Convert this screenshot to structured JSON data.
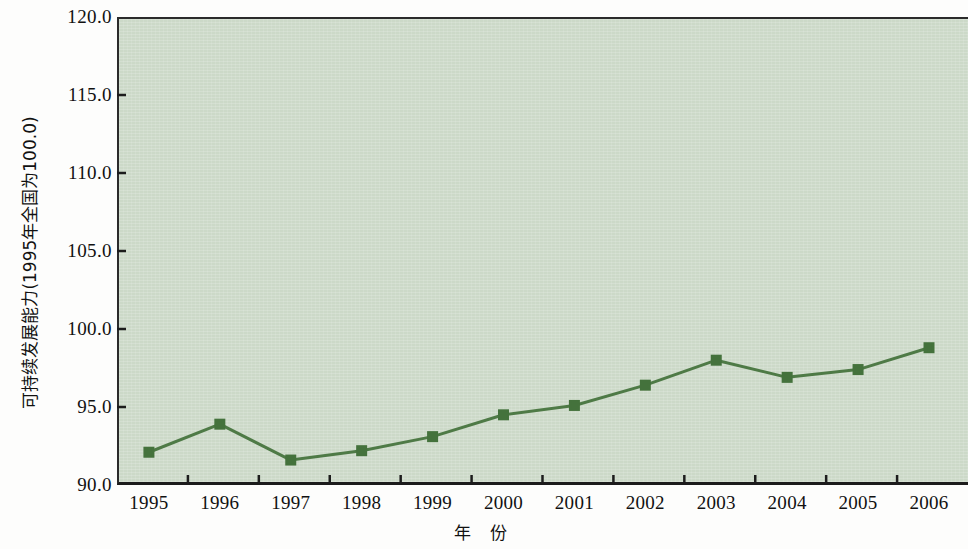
{
  "chart_data": {
    "type": "line",
    "title": "",
    "subtitle": "",
    "xlabel": "年 份",
    "ylabel": "可持续发展能力(1995年全国为100.0)",
    "categories": [
      "1995",
      "1996",
      "1997",
      "1998",
      "1999",
      "2000",
      "2001",
      "2002",
      "2003",
      "2004",
      "2005",
      "2006"
    ],
    "series": [
      {
        "name": "可持续发展能力",
        "values": [
          92.1,
          93.9,
          91.6,
          92.2,
          93.1,
          94.5,
          95.1,
          96.4,
          98.0,
          96.9,
          97.4,
          98.8
        ]
      }
    ],
    "ylim": [
      90.0,
      120.0
    ],
    "ytick_labels": [
      "90.0",
      "95.0",
      "100.0",
      "105.0",
      "110.0",
      "115.0",
      "120.0"
    ],
    "ytick_values": [
      90.0,
      95.0,
      100.0,
      105.0,
      110.0,
      115.0,
      120.0
    ],
    "xtick_labels": [
      "1995",
      "1996",
      "1997",
      "1998",
      "1999",
      "2000",
      "2001",
      "2002",
      "2003",
      "2004",
      "2005",
      "2006"
    ],
    "grid": false,
    "legend": "none",
    "marker": "square",
    "colors": {
      "line": "#4e7a46",
      "marker": "#44723c",
      "plot_background": "#ccd9c8",
      "axis": "#1c1c1c",
      "text": "#111111",
      "figure_background": "#fdfdfc"
    }
  }
}
